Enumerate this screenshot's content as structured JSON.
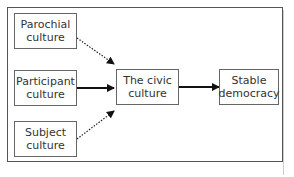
{
  "diagram": {
    "nodes": [
      {
        "id": "parochial",
        "label_line1": "Parochial",
        "label_line2": "culture"
      },
      {
        "id": "participant",
        "label_line1": "Participant",
        "label_line2": "culture"
      },
      {
        "id": "subject",
        "label_line1": "Subject",
        "label_line2": "culture"
      },
      {
        "id": "civic",
        "label_line1": "The civic",
        "label_line2": "culture"
      },
      {
        "id": "stable",
        "label_line1": "Stable",
        "label_line2": "democracy"
      }
    ],
    "edges": [
      {
        "from": "parochial",
        "to": "civic",
        "style": "dotted"
      },
      {
        "from": "participant",
        "to": "civic",
        "style": "solid-bold"
      },
      {
        "from": "subject",
        "to": "civic",
        "style": "dotted"
      },
      {
        "from": "civic",
        "to": "stable",
        "style": "solid-bold"
      }
    ],
    "colors": {
      "border": "#666666",
      "arrow": "#111111",
      "text": "#333333"
    }
  }
}
